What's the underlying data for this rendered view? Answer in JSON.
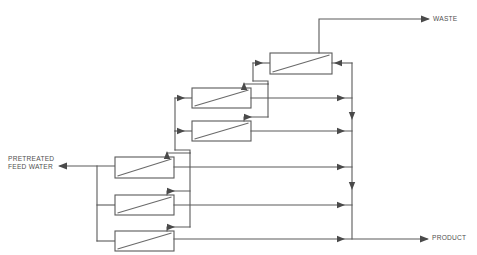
{
  "diagram": {
    "type": "process-flow-diagram",
    "canvas": {
      "width": 477,
      "height": 255
    },
    "line_color": "#5a5a5a",
    "background_color": "#ffffff",
    "labels": {
      "feed_line1": "PRETREATED",
      "feed_line2": "FEED WATER",
      "waste": "WASTE",
      "product": "PRODUCT"
    },
    "streams": [
      {
        "name": "pretreated-feed-water",
        "direction": "inlet",
        "side": "left"
      },
      {
        "name": "waste",
        "direction": "outlet",
        "side": "top-right"
      },
      {
        "name": "product",
        "direction": "outlet",
        "side": "bottom-right"
      }
    ],
    "stages": [
      {
        "stage": 1,
        "modules": 3,
        "label": "first-stage-bank"
      },
      {
        "stage": 2,
        "modules": 2,
        "label": "second-stage-bank"
      },
      {
        "stage": 3,
        "modules": 1,
        "label": "third-stage-bank"
      }
    ],
    "modules": [
      {
        "id": "module-1",
        "stage": 1,
        "x": 115,
        "y": 157,
        "w": 59,
        "h": 21
      },
      {
        "id": "module-2",
        "stage": 1,
        "x": 115,
        "y": 195,
        "w": 59,
        "h": 20
      },
      {
        "id": "module-3",
        "stage": 1,
        "x": 115,
        "y": 231,
        "w": 59,
        "h": 20
      },
      {
        "id": "module-4",
        "stage": 2,
        "x": 192,
        "y": 88,
        "w": 59,
        "h": 20
      },
      {
        "id": "module-5",
        "stage": 2,
        "x": 192,
        "y": 121,
        "w": 59,
        "h": 20
      },
      {
        "id": "module-6",
        "stage": 3,
        "x": 270,
        "y": 53,
        "w": 62,
        "h": 21
      }
    ],
    "collector": {
      "name": "permeate-collector",
      "x": 352,
      "y_top": 63,
      "y_bottom": 239
    }
  }
}
